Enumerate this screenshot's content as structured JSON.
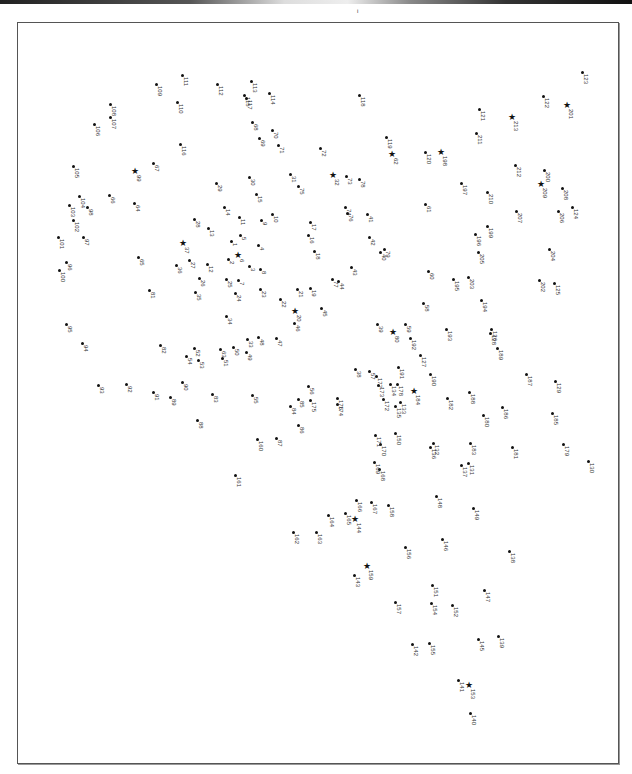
{
  "page": {
    "corner_mark": "i"
  },
  "puzzle": {
    "type": "dot-to-dot",
    "points": [
      {
        "n": "1",
        "x": 231,
        "y": 241,
        "s": 0
      },
      {
        "n": "2",
        "x": 228,
        "y": 259,
        "s": 0
      },
      {
        "n": "3",
        "x": 249,
        "y": 266,
        "s": 0
      },
      {
        "n": "4",
        "x": 258,
        "y": 245,
        "s": 0
      },
      {
        "n": "5",
        "x": 240,
        "y": 235,
        "s": 0
      },
      {
        "n": "6",
        "x": 238,
        "y": 257,
        "s": 1
      },
      {
        "n": "7",
        "x": 238,
        "y": 280,
        "s": 0
      },
      {
        "n": "8",
        "x": 260,
        "y": 269,
        "s": 0
      },
      {
        "n": "9",
        "x": 261,
        "y": 220,
        "s": 0
      },
      {
        "n": "10",
        "x": 272,
        "y": 214,
        "s": 0
      },
      {
        "n": "11",
        "x": 239,
        "y": 217,
        "s": 0
      },
      {
        "n": "12",
        "x": 207,
        "y": 264,
        "s": 0
      },
      {
        "n": "13",
        "x": 208,
        "y": 228,
        "s": 0
      },
      {
        "n": "14",
        "x": 224,
        "y": 207,
        "s": 0
      },
      {
        "n": "15",
        "x": 256,
        "y": 194,
        "s": 0
      },
      {
        "n": "16",
        "x": 308,
        "y": 235,
        "s": 0
      },
      {
        "n": "17",
        "x": 310,
        "y": 222,
        "s": 0
      },
      {
        "n": "18",
        "x": 314,
        "y": 251,
        "s": 0
      },
      {
        "n": "19",
        "x": 310,
        "y": 288,
        "s": 0
      },
      {
        "n": "20",
        "x": 295,
        "y": 313,
        "s": 1
      },
      {
        "n": "21",
        "x": 297,
        "y": 289,
        "s": 0
      },
      {
        "n": "22",
        "x": 280,
        "y": 299,
        "s": 0
      },
      {
        "n": "23",
        "x": 260,
        "y": 289,
        "s": 0
      },
      {
        "n": "24",
        "x": 235,
        "y": 293,
        "s": 0
      },
      {
        "n": "25",
        "x": 226,
        "y": 279,
        "s": 0
      },
      {
        "n": "26",
        "x": 199,
        "y": 278,
        "s": 0
      },
      {
        "n": "27",
        "x": 189,
        "y": 260,
        "s": 0
      },
      {
        "n": "28",
        "x": 194,
        "y": 219,
        "s": 0
      },
      {
        "n": "29",
        "x": 216,
        "y": 183,
        "s": 0
      },
      {
        "n": "30",
        "x": 249,
        "y": 177,
        "s": 0
      },
      {
        "n": "31",
        "x": 290,
        "y": 174,
        "s": 0
      },
      {
        "n": "32",
        "x": 333,
        "y": 177,
        "s": 1
      },
      {
        "n": "33",
        "x": 247,
        "y": 339,
        "s": 0
      },
      {
        "n": "34",
        "x": 226,
        "y": 316,
        "s": 0
      },
      {
        "n": "35",
        "x": 195,
        "y": 292,
        "s": 0
      },
      {
        "n": "36",
        "x": 176,
        "y": 265,
        "s": 0
      },
      {
        "n": "37",
        "x": 183,
        "y": 245,
        "s": 1
      },
      {
        "n": "38",
        "x": 355,
        "y": 369,
        "s": 0
      },
      {
        "n": "39",
        "x": 377,
        "y": 324,
        "s": 0
      },
      {
        "n": "40",
        "x": 380,
        "y": 252,
        "s": 0
      },
      {
        "n": "41",
        "x": 367,
        "y": 214,
        "s": 0
      },
      {
        "n": "42",
        "x": 369,
        "y": 237,
        "s": 0
      },
      {
        "n": "43",
        "x": 351,
        "y": 267,
        "s": 0
      },
      {
        "n": "44",
        "x": 338,
        "y": 281,
        "s": 0
      },
      {
        "n": "45",
        "x": 321,
        "y": 308,
        "s": 0
      },
      {
        "n": "46",
        "x": 294,
        "y": 323,
        "s": 0
      },
      {
        "n": "47",
        "x": 276,
        "y": 338,
        "s": 0
      },
      {
        "n": "48",
        "x": 258,
        "y": 337,
        "s": 0
      },
      {
        "n": "49",
        "x": 246,
        "y": 352,
        "s": 0
      },
      {
        "n": "50",
        "x": 233,
        "y": 347,
        "s": 0
      },
      {
        "n": "51",
        "x": 222,
        "y": 358,
        "s": 0
      },
      {
        "n": "52",
        "x": 194,
        "y": 348,
        "s": 0
      },
      {
        "n": "53",
        "x": 198,
        "y": 360,
        "s": 0
      },
      {
        "n": "54",
        "x": 186,
        "y": 356,
        "s": 0
      },
      {
        "n": "55",
        "x": 252,
        "y": 395,
        "s": 0
      },
      {
        "n": "56",
        "x": 308,
        "y": 386,
        "s": 0
      },
      {
        "n": "57",
        "x": 369,
        "y": 371,
        "s": 0
      },
      {
        "n": "58",
        "x": 423,
        "y": 303,
        "s": 0
      },
      {
        "n": "59",
        "x": 405,
        "y": 324,
        "s": 0
      },
      {
        "n": "60",
        "x": 428,
        "y": 271,
        "s": 0
      },
      {
        "n": "61",
        "x": 425,
        "y": 204,
        "s": 0
      },
      {
        "n": "62",
        "x": 392,
        "y": 156,
        "s": 1
      },
      {
        "n": "63",
        "x": 220,
        "y": 349,
        "s": 0
      },
      {
        "n": "64",
        "x": 134,
        "y": 203,
        "s": 0
      },
      {
        "n": "65",
        "x": 138,
        "y": 257,
        "s": 0
      },
      {
        "n": "66",
        "x": 109,
        "y": 195,
        "s": 0
      },
      {
        "n": "67",
        "x": 153,
        "y": 163,
        "s": 0
      },
      {
        "n": "68",
        "x": 252,
        "y": 122,
        "s": 0
      },
      {
        "n": "69",
        "x": 259,
        "y": 138,
        "s": 0
      },
      {
        "n": "70",
        "x": 272,
        "y": 130,
        "s": 0
      },
      {
        "n": "71",
        "x": 278,
        "y": 145,
        "s": 0
      },
      {
        "n": "72",
        "x": 320,
        "y": 148,
        "s": 0
      },
      {
        "n": "73",
        "x": 346,
        "y": 176,
        "s": 0
      },
      {
        "n": "74",
        "x": 345,
        "y": 207,
        "s": 0
      },
      {
        "n": "75",
        "x": 298,
        "y": 186,
        "s": 0
      },
      {
        "n": "76",
        "x": 347,
        "y": 213,
        "s": 0
      },
      {
        "n": "77",
        "x": 332,
        "y": 279,
        "s": 0
      },
      {
        "n": "78",
        "x": 359,
        "y": 179,
        "s": 0
      },
      {
        "n": "79",
        "x": 384,
        "y": 249,
        "s": 0
      },
      {
        "n": "80",
        "x": 393,
        "y": 334,
        "s": 1
      },
      {
        "n": "81",
        "x": 149,
        "y": 290,
        "s": 0
      },
      {
        "n": "82",
        "x": 160,
        "y": 345,
        "s": 0
      },
      {
        "n": "83",
        "x": 212,
        "y": 394,
        "s": 0
      },
      {
        "n": "84",
        "x": 290,
        "y": 406,
        "s": 0
      },
      {
        "n": "85",
        "x": 298,
        "y": 399,
        "s": 0
      },
      {
        "n": "86",
        "x": 298,
        "y": 425,
        "s": 0
      },
      {
        "n": "87",
        "x": 276,
        "y": 438,
        "s": 0
      },
      {
        "n": "88",
        "x": 197,
        "y": 420,
        "s": 0
      },
      {
        "n": "89",
        "x": 170,
        "y": 397,
        "s": 0
      },
      {
        "n": "90",
        "x": 182,
        "y": 382,
        "s": 0
      },
      {
        "n": "91",
        "x": 153,
        "y": 392,
        "s": 0
      },
      {
        "n": "92",
        "x": 126,
        "y": 384,
        "s": 0
      },
      {
        "n": "93",
        "x": 98,
        "y": 385,
        "s": 0
      },
      {
        "n": "94",
        "x": 82,
        "y": 343,
        "s": 0
      },
      {
        "n": "95",
        "x": 66,
        "y": 324,
        "s": 0
      },
      {
        "n": "96",
        "x": 66,
        "y": 262,
        "s": 0
      },
      {
        "n": "97",
        "x": 83,
        "y": 237,
        "s": 0
      },
      {
        "n": "98",
        "x": 87,
        "y": 207,
        "s": 0
      },
      {
        "n": "99",
        "x": 135,
        "y": 173,
        "s": 1
      },
      {
        "n": "100",
        "x": 59,
        "y": 270,
        "s": 0
      },
      {
        "n": "101",
        "x": 58,
        "y": 237,
        "s": 0
      },
      {
        "n": "102",
        "x": 73,
        "y": 220,
        "s": 0
      },
      {
        "n": "103",
        "x": 69,
        "y": 205,
        "s": 0
      },
      {
        "n": "104",
        "x": 79,
        "y": 196,
        "s": 0
      },
      {
        "n": "105",
        "x": 73,
        "y": 166,
        "s": 0
      },
      {
        "n": "106",
        "x": 94,
        "y": 124,
        "s": 0
      },
      {
        "n": "107",
        "x": 110,
        "y": 117,
        "s": 0
      },
      {
        "n": "108",
        "x": 110,
        "y": 104,
        "s": 0
      },
      {
        "n": "109",
        "x": 156,
        "y": 84,
        "s": 0
      },
      {
        "n": "110",
        "x": 177,
        "y": 102,
        "s": 0
      },
      {
        "n": "111",
        "x": 182,
        "y": 75,
        "s": 0
      },
      {
        "n": "112",
        "x": 217,
        "y": 84,
        "s": 0
      },
      {
        "n": "113",
        "x": 251,
        "y": 81,
        "s": 0
      },
      {
        "n": "114",
        "x": 269,
        "y": 93,
        "s": 0
      },
      {
        "n": "115",
        "x": 244,
        "y": 95,
        "s": 0
      },
      {
        "n": "116",
        "x": 180,
        "y": 144,
        "s": 0
      },
      {
        "n": "117",
        "x": 246,
        "y": 98,
        "s": 0
      },
      {
        "n": "118",
        "x": 359,
        "y": 95,
        "s": 0
      },
      {
        "n": "119",
        "x": 386,
        "y": 137,
        "s": 0
      },
      {
        "n": "120",
        "x": 425,
        "y": 152,
        "s": 0
      },
      {
        "n": "121",
        "x": 479,
        "y": 109,
        "s": 0
      },
      {
        "n": "122",
        "x": 543,
        "y": 96,
        "s": 0
      },
      {
        "n": "123",
        "x": 582,
        "y": 72,
        "s": 0
      },
      {
        "n": "124",
        "x": 572,
        "y": 207,
        "s": 0
      },
      {
        "n": "125",
        "x": 554,
        "y": 283,
        "s": 0
      },
      {
        "n": "126",
        "x": 491,
        "y": 329,
        "s": 0
      },
      {
        "n": "127",
        "x": 420,
        "y": 355,
        "s": 0
      },
      {
        "n": "128",
        "x": 490,
        "y": 333,
        "s": 0
      },
      {
        "n": "129",
        "x": 555,
        "y": 381,
        "s": 0
      },
      {
        "n": "130",
        "x": 588,
        "y": 461,
        "s": 0
      },
      {
        "n": "131",
        "x": 468,
        "y": 463,
        "s": 0
      },
      {
        "n": "132",
        "x": 433,
        "y": 443,
        "s": 0
      },
      {
        "n": "133",
        "x": 400,
        "y": 402,
        "s": 0
      },
      {
        "n": "134",
        "x": 390,
        "y": 384,
        "s": 0
      },
      {
        "n": "135",
        "x": 395,
        "y": 406,
        "s": 0
      },
      {
        "n": "136",
        "x": 430,
        "y": 447,
        "s": 0
      },
      {
        "n": "137",
        "x": 461,
        "y": 465,
        "s": 0
      },
      {
        "n": "138",
        "x": 509,
        "y": 551,
        "s": 0
      },
      {
        "n": "139",
        "x": 498,
        "y": 636,
        "s": 0
      },
      {
        "n": "140",
        "x": 470,
        "y": 713,
        "s": 0
      },
      {
        "n": "141",
        "x": 458,
        "y": 680,
        "s": 0
      },
      {
        "n": "142",
        "x": 412,
        "y": 644,
        "s": 0
      },
      {
        "n": "143",
        "x": 354,
        "y": 575,
        "s": 0
      },
      {
        "n": "144",
        "x": 355,
        "y": 521,
        "s": 1
      },
      {
        "n": "145",
        "x": 478,
        "y": 639,
        "s": 0
      },
      {
        "n": "146",
        "x": 442,
        "y": 539,
        "s": 0
      },
      {
        "n": "147",
        "x": 484,
        "y": 590,
        "s": 0
      },
      {
        "n": "148",
        "x": 436,
        "y": 496,
        "s": 0
      },
      {
        "n": "149",
        "x": 473,
        "y": 508,
        "s": 0
      },
      {
        "n": "150",
        "x": 395,
        "y": 433,
        "s": 0
      },
      {
        "n": "151",
        "x": 432,
        "y": 585,
        "s": 0
      },
      {
        "n": "152",
        "x": 452,
        "y": 605,
        "s": 0
      },
      {
        "n": "153",
        "x": 469,
        "y": 687,
        "s": 1
      },
      {
        "n": "154",
        "x": 431,
        "y": 603,
        "s": 0
      },
      {
        "n": "155",
        "x": 429,
        "y": 643,
        "s": 0
      },
      {
        "n": "156",
        "x": 405,
        "y": 547,
        "s": 0
      },
      {
        "n": "157",
        "x": 395,
        "y": 602,
        "s": 0
      },
      {
        "n": "158",
        "x": 388,
        "y": 505,
        "s": 0
      },
      {
        "n": "159",
        "x": 367,
        "y": 568,
        "s": 1
      },
      {
        "n": "160",
        "x": 257,
        "y": 439,
        "s": 0
      },
      {
        "n": "161",
        "x": 235,
        "y": 475,
        "s": 0
      },
      {
        "n": "162",
        "x": 293,
        "y": 532,
        "s": 0
      },
      {
        "n": "163",
        "x": 316,
        "y": 532,
        "s": 0
      },
      {
        "n": "164",
        "x": 328,
        "y": 515,
        "s": 0
      },
      {
        "n": "165",
        "x": 345,
        "y": 513,
        "s": 0
      },
      {
        "n": "166",
        "x": 356,
        "y": 500,
        "s": 0
      },
      {
        "n": "167",
        "x": 371,
        "y": 502,
        "s": 0
      },
      {
        "n": "168",
        "x": 379,
        "y": 469,
        "s": 0
      },
      {
        "n": "169",
        "x": 374,
        "y": 462,
        "s": 0
      },
      {
        "n": "170",
        "x": 380,
        "y": 444,
        "s": 0
      },
      {
        "n": "171",
        "x": 375,
        "y": 435,
        "s": 0
      },
      {
        "n": "172",
        "x": 383,
        "y": 399,
        "s": 0
      },
      {
        "n": "173",
        "x": 378,
        "y": 385,
        "s": 0
      },
      {
        "n": "174",
        "x": 337,
        "y": 404,
        "s": 0
      },
      {
        "n": "175",
        "x": 310,
        "y": 400,
        "s": 0
      },
      {
        "n": "176",
        "x": 337,
        "y": 398,
        "s": 0
      },
      {
        "n": "177",
        "x": 376,
        "y": 376,
        "s": 0
      },
      {
        "n": "178",
        "x": 397,
        "y": 384,
        "s": 0
      },
      {
        "n": "179",
        "x": 563,
        "y": 444,
        "s": 0
      },
      {
        "n": "180",
        "x": 483,
        "y": 415,
        "s": 0
      },
      {
        "n": "181",
        "x": 512,
        "y": 447,
        "s": 0
      },
      {
        "n": "182",
        "x": 447,
        "y": 398,
        "s": 0
      },
      {
        "n": "183",
        "x": 470,
        "y": 443,
        "s": 0
      },
      {
        "n": "184",
        "x": 414,
        "y": 393,
        "s": 1
      },
      {
        "n": "185",
        "x": 552,
        "y": 413,
        "s": 0
      },
      {
        "n": "186",
        "x": 502,
        "y": 407,
        "s": 0
      },
      {
        "n": "187",
        "x": 526,
        "y": 374,
        "s": 0
      },
      {
        "n": "188",
        "x": 469,
        "y": 392,
        "s": 0
      },
      {
        "n": "189",
        "x": 497,
        "y": 348,
        "s": 0
      },
      {
        "n": "190",
        "x": 430,
        "y": 374,
        "s": 0
      },
      {
        "n": "191",
        "x": 398,
        "y": 367,
        "s": 0
      },
      {
        "n": "192",
        "x": 410,
        "y": 338,
        "s": 0
      },
      {
        "n": "193",
        "x": 446,
        "y": 329,
        "s": 0
      },
      {
        "n": "194",
        "x": 481,
        "y": 300,
        "s": 0
      },
      {
        "n": "195",
        "x": 453,
        "y": 279,
        "s": 0
      },
      {
        "n": "196",
        "x": 475,
        "y": 234,
        "s": 0
      },
      {
        "n": "197",
        "x": 461,
        "y": 183,
        "s": 0
      },
      {
        "n": "198",
        "x": 441,
        "y": 154,
        "s": 1
      },
      {
        "n": "199",
        "x": 487,
        "y": 226,
        "s": 0
      },
      {
        "n": "200",
        "x": 544,
        "y": 170,
        "s": 0
      },
      {
        "n": "201",
        "x": 567,
        "y": 107,
        "s": 1
      },
      {
        "n": "202",
        "x": 539,
        "y": 280,
        "s": 0
      },
      {
        "n": "203",
        "x": 468,
        "y": 277,
        "s": 0
      },
      {
        "n": "204",
        "x": 549,
        "y": 249,
        "s": 0
      },
      {
        "n": "205",
        "x": 478,
        "y": 252,
        "s": 0
      },
      {
        "n": "206",
        "x": 558,
        "y": 211,
        "s": 0
      },
      {
        "n": "207",
        "x": 516,
        "y": 211,
        "s": 0
      },
      {
        "n": "208",
        "x": 562,
        "y": 188,
        "s": 0
      },
      {
        "n": "209",
        "x": 541,
        "y": 186,
        "s": 1
      },
      {
        "n": "210",
        "x": 487,
        "y": 192,
        "s": 0
      },
      {
        "n": "211",
        "x": 476,
        "y": 133,
        "s": 0
      },
      {
        "n": "212",
        "x": 515,
        "y": 165,
        "s": 0
      },
      {
        "n": "213",
        "x": 512,
        "y": 119,
        "s": 1
      }
    ]
  }
}
